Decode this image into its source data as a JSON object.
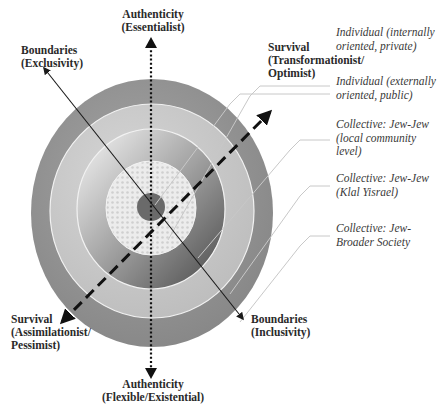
{
  "diagram": {
    "axes": {
      "authenticity_top": {
        "line1": "Authenticity",
        "line2": "(Essentialist)"
      },
      "authenticity_bottom": {
        "line1": "Authenticity",
        "line2": "(Flexible/Existential)"
      },
      "boundaries_top_left": {
        "line1": "Boundaries",
        "line2": "(Exclusivity)"
      },
      "boundaries_bottom_right": {
        "line1": "Boundaries",
        "line2": "(Inclusivity)"
      },
      "survival_top_right": {
        "line1": "Survival",
        "line2": "(Transformationist/",
        "line3": "Optimist)"
      },
      "survival_bottom_left": {
        "line1": "Survival",
        "line2": "(Assimilationist/",
        "line3": "Pessimist)"
      }
    },
    "layers": [
      {
        "line1": "Individual (internally",
        "line2": "oriented, private)"
      },
      {
        "line1": "Individual (externally",
        "line2": "oriented, public)"
      },
      {
        "line1": "Collective: Jew-Jew",
        "line2": "(local community",
        "line3": "level)"
      },
      {
        "line1": "Collective: Jew-Jew",
        "line2": "(Klal Yisrael)"
      },
      {
        "line1": "Collective: Jew-",
        "line2": "Broader Society"
      }
    ],
    "colors": {
      "outer_ring": "#8e8e8e",
      "second_ring": "#c4c4c4",
      "third_ring_light": "#d8d8d8",
      "third_ring_dark": "#6f6f6f",
      "lattice_core": "#e6e6e6",
      "center_dot": "#6a6a6a",
      "leader_line": "#c8c8c8",
      "axis_line": "#1a1a1a"
    }
  }
}
